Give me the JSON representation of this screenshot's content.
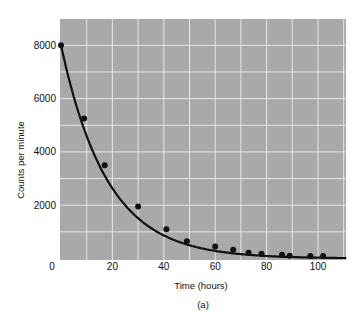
{
  "chart_data": {
    "type": "scatter",
    "title": "",
    "xlabel": "Time (hours)",
    "ylabel": "Counts per minute",
    "caption": "(a)",
    "xlim": [
      0,
      111
    ],
    "ylim": [
      0,
      9000
    ],
    "x_ticks": [
      0,
      20,
      40,
      60,
      80,
      100
    ],
    "y_ticks": [
      2000,
      4000,
      6000,
      8000
    ],
    "y_zero_label": "0",
    "grid": true,
    "grid_x_step": 10,
    "grid_y_step": 1000,
    "legend": null,
    "series": [
      {
        "name": "Measured counts",
        "kind": "points",
        "x": [
          0,
          9,
          17,
          30,
          41,
          49,
          60,
          67,
          73,
          78,
          86,
          89,
          97,
          102
        ],
        "y": [
          8000,
          5250,
          3500,
          1950,
          1100,
          650,
          450,
          330,
          220,
          180,
          140,
          100,
          90,
          90
        ]
      },
      {
        "name": "Exponential decay fit",
        "kind": "curve",
        "formula": "y = 8000 * exp(-t / 18)",
        "x_range": [
          0,
          111
        ]
      }
    ],
    "colors": {
      "plot_background": "#a9a9a9",
      "grid": "#e6e6e6",
      "data": "#111111"
    }
  }
}
